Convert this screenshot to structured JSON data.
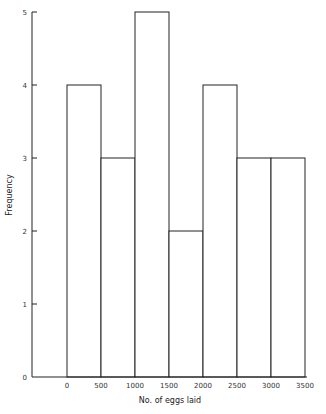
{
  "chart_data": {
    "type": "bar",
    "subtype": "histogram",
    "title": "",
    "xlabel": "No. of eggs laid",
    "ylabel": "Frequency",
    "bin_edges": [
      0,
      500,
      1000,
      1500,
      2000,
      2500,
      3000,
      3500
    ],
    "categories": [
      "0-500",
      "500-1000",
      "1000-1500",
      "1500-2000",
      "2000-2500",
      "2500-3000",
      "3000-3500"
    ],
    "values": [
      4,
      3,
      5,
      2,
      4,
      3,
      3
    ],
    "x_ticks": [
      "0",
      "500",
      "1000",
      "1500",
      "2000",
      "2500",
      "3000",
      "3500"
    ],
    "y_ticks": [
      "0",
      "1",
      "2",
      "3",
      "4",
      "5"
    ],
    "ylim": [
      0,
      5
    ],
    "xlim": [
      -500,
      3500
    ],
    "grid": false,
    "legend": null
  }
}
